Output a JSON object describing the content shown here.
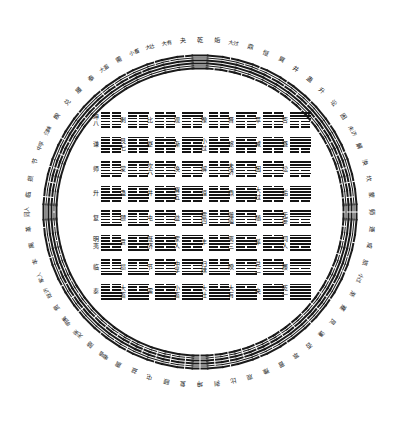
{
  "diagram": {
    "title_en": "Fuxi 64 Hexagram Circular and Square Diagram",
    "type": "iching-fuxi-arrangement",
    "background_color": "#ffffff",
    "ink_color": "#1a1a1a",
    "circle": {
      "name": "圆图",
      "count": 64,
      "radius_px": 172,
      "center": {
        "x": 200,
        "y": 212
      },
      "start_angle_deg": -90,
      "direction": "clockwise"
    },
    "square": {
      "name": "方图",
      "rows": 8,
      "cols": 8,
      "count": 64
    },
    "legend": {
      "yang_label": "阳爻 (solid line)",
      "yin_label": "阴爻 (broken line)",
      "read_order": "bottom line first"
    }
  },
  "circle_hexagrams": [
    {
      "name": "乾",
      "lines": "111111"
    },
    {
      "name": "姤",
      "lines": "011111"
    },
    {
      "name": "大过",
      "lines": "011110"
    },
    {
      "name": "鼎",
      "lines": "011101"
    },
    {
      "name": "恒",
      "lines": "011100"
    },
    {
      "name": "巽",
      "lines": "011011"
    },
    {
      "name": "井",
      "lines": "011010"
    },
    {
      "name": "蛊",
      "lines": "011001"
    },
    {
      "name": "升",
      "lines": "011000"
    },
    {
      "name": "讼",
      "lines": "010111"
    },
    {
      "name": "困",
      "lines": "010110"
    },
    {
      "name": "未济",
      "lines": "010101"
    },
    {
      "name": "解",
      "lines": "010100"
    },
    {
      "name": "涣",
      "lines": "010011"
    },
    {
      "name": "坎",
      "lines": "010010"
    },
    {
      "name": "蒙",
      "lines": "010001"
    },
    {
      "name": "师",
      "lines": "010000"
    },
    {
      "name": "遯",
      "lines": "001111"
    },
    {
      "name": "咸",
      "lines": "001110"
    },
    {
      "name": "旅",
      "lines": "001101"
    },
    {
      "name": "小过",
      "lines": "001100"
    },
    {
      "name": "渐",
      "lines": "001011"
    },
    {
      "name": "蹇",
      "lines": "001010"
    },
    {
      "name": "艮",
      "lines": "001001"
    },
    {
      "name": "谦",
      "lines": "001000"
    },
    {
      "name": "否",
      "lines": "000111"
    },
    {
      "name": "萃",
      "lines": "000110"
    },
    {
      "name": "晋",
      "lines": "000101"
    },
    {
      "name": "豫",
      "lines": "000100"
    },
    {
      "name": "观",
      "lines": "000011"
    },
    {
      "name": "比",
      "lines": "000010"
    },
    {
      "name": "剥",
      "lines": "000001"
    },
    {
      "name": "坤",
      "lines": "000000"
    },
    {
      "name": "复",
      "lines": "100000"
    },
    {
      "name": "颐",
      "lines": "100001"
    },
    {
      "name": "屯",
      "lines": "100010"
    },
    {
      "name": "益",
      "lines": "100011"
    },
    {
      "name": "震",
      "lines": "100100"
    },
    {
      "name": "噬嗑",
      "lines": "100101"
    },
    {
      "name": "随",
      "lines": "100110"
    },
    {
      "name": "无妄",
      "lines": "100111"
    },
    {
      "name": "明夷",
      "lines": "101000"
    },
    {
      "name": "贲",
      "lines": "101001"
    },
    {
      "name": "既济",
      "lines": "101010"
    },
    {
      "name": "家人",
      "lines": "101011"
    },
    {
      "name": "丰",
      "lines": "101100"
    },
    {
      "name": "离",
      "lines": "101101"
    },
    {
      "name": "革",
      "lines": "101110"
    },
    {
      "name": "同人",
      "lines": "101111"
    },
    {
      "name": "临",
      "lines": "110000"
    },
    {
      "name": "损",
      "lines": "110001"
    },
    {
      "name": "节",
      "lines": "110010"
    },
    {
      "name": "中孚",
      "lines": "110011"
    },
    {
      "name": "归妹",
      "lines": "110100"
    },
    {
      "name": "睽",
      "lines": "110101"
    },
    {
      "name": "兑",
      "lines": "110110"
    },
    {
      "name": "履",
      "lines": "110111"
    },
    {
      "name": "泰",
      "lines": "111000"
    },
    {
      "name": "大畜",
      "lines": "111001"
    },
    {
      "name": "需",
      "lines": "111010"
    },
    {
      "name": "小畜",
      "lines": "111011"
    },
    {
      "name": "大壮",
      "lines": "111100"
    },
    {
      "name": "大有",
      "lines": "111101"
    },
    {
      "name": "夬",
      "lines": "111110"
    }
  ],
  "square_rows": [
    {
      "row": 1,
      "cells": [
        {
          "name": "坤",
          "extra": "八",
          "lines": "000000"
        },
        {
          "name": "剥",
          "extra": "",
          "lines": "000001"
        },
        {
          "name": "比",
          "extra": "",
          "lines": "000010"
        },
        {
          "name": "观",
          "extra": "",
          "lines": "000011"
        },
        {
          "name": "豫",
          "extra": "",
          "lines": "000100"
        },
        {
          "name": "晋",
          "extra": "",
          "lines": "000101"
        },
        {
          "name": "萃",
          "extra": "",
          "lines": "000110"
        },
        {
          "name": "否",
          "extra": "",
          "lines": "000111"
        }
      ]
    },
    {
      "row": 2,
      "cells": [
        {
          "name": "谦",
          "extra": "",
          "lines": "001000"
        },
        {
          "name": "艮",
          "extra": "七",
          "lines": "001001"
        },
        {
          "name": "蹇",
          "extra": "",
          "lines": "001010"
        },
        {
          "name": "渐",
          "extra": "",
          "lines": "001011"
        },
        {
          "name": "小过",
          "extra": "",
          "lines": "001100"
        },
        {
          "name": "旅",
          "extra": "",
          "lines": "001101"
        },
        {
          "name": "咸",
          "extra": "",
          "lines": "001110"
        },
        {
          "name": "遯",
          "extra": "",
          "lines": "001111"
        }
      ]
    },
    {
      "row": 3,
      "cells": [
        {
          "name": "师",
          "extra": "",
          "lines": "010000"
        },
        {
          "name": "蒙",
          "extra": "",
          "lines": "010001"
        },
        {
          "name": "坎",
          "extra": "六",
          "lines": "010010"
        },
        {
          "name": "涣",
          "extra": "",
          "lines": "010011"
        },
        {
          "name": "解",
          "extra": "",
          "lines": "010100"
        },
        {
          "name": "未济",
          "extra": "",
          "lines": "010101"
        },
        {
          "name": "困",
          "extra": "",
          "lines": "010110"
        },
        {
          "name": "讼",
          "extra": "",
          "lines": "010111"
        }
      ]
    },
    {
      "row": 4,
      "cells": [
        {
          "name": "升",
          "extra": "",
          "lines": "011000"
        },
        {
          "name": "蛊",
          "extra": "",
          "lines": "011001"
        },
        {
          "name": "井",
          "extra": "",
          "lines": "011010"
        },
        {
          "name": "巽",
          "extra": "五",
          "lines": "011011"
        },
        {
          "name": "恒",
          "extra": "",
          "lines": "011100"
        },
        {
          "name": "鼎",
          "extra": "",
          "lines": "011101"
        },
        {
          "name": "大过",
          "extra": "",
          "lines": "011110"
        },
        {
          "name": "姤",
          "extra": "",
          "lines": "011111"
        }
      ]
    },
    {
      "row": 5,
      "cells": [
        {
          "name": "复",
          "extra": "",
          "lines": "100000"
        },
        {
          "name": "颐",
          "extra": "",
          "lines": "100001"
        },
        {
          "name": "屯",
          "extra": "",
          "lines": "100010"
        },
        {
          "name": "益",
          "extra": "",
          "lines": "100011"
        },
        {
          "name": "震",
          "extra": "四",
          "lines": "100100"
        },
        {
          "name": "噬嗑",
          "extra": "",
          "lines": "100101"
        },
        {
          "name": "随",
          "extra": "",
          "lines": "100110"
        },
        {
          "name": "无妄",
          "extra": "",
          "lines": "100111"
        }
      ]
    },
    {
      "row": 6,
      "cells": [
        {
          "name": "明夷",
          "extra": "",
          "lines": "101000"
        },
        {
          "name": "贲",
          "extra": "",
          "lines": "101001"
        },
        {
          "name": "既济",
          "extra": "",
          "lines": "101010"
        },
        {
          "name": "家人",
          "extra": "",
          "lines": "101011"
        },
        {
          "name": "丰",
          "extra": "",
          "lines": "101100"
        },
        {
          "name": "离",
          "extra": "三",
          "lines": "101101"
        },
        {
          "name": "革",
          "extra": "",
          "lines": "101110"
        },
        {
          "name": "同人",
          "extra": "",
          "lines": "101111"
        }
      ]
    },
    {
      "row": 7,
      "cells": [
        {
          "name": "临",
          "extra": "",
          "lines": "110000"
        },
        {
          "name": "损",
          "extra": "",
          "lines": "110001"
        },
        {
          "name": "节",
          "extra": "",
          "lines": "110010"
        },
        {
          "name": "中孚",
          "extra": "",
          "lines": "110011"
        },
        {
          "name": "归妹",
          "extra": "",
          "lines": "110100"
        },
        {
          "name": "睽",
          "extra": "",
          "lines": "110101"
        },
        {
          "name": "兑",
          "extra": "二",
          "lines": "110110"
        },
        {
          "name": "履",
          "extra": "",
          "lines": "110111"
        }
      ]
    },
    {
      "row": 8,
      "cells": [
        {
          "name": "泰",
          "extra": "",
          "lines": "111000"
        },
        {
          "name": "大畜",
          "extra": "",
          "lines": "111001"
        },
        {
          "name": "需",
          "extra": "",
          "lines": "111010"
        },
        {
          "name": "小畜",
          "extra": "",
          "lines": "111011"
        },
        {
          "name": "大壮",
          "extra": "",
          "lines": "111100"
        },
        {
          "name": "大有",
          "extra": "",
          "lines": "111101"
        },
        {
          "name": "夬",
          "extra": "",
          "lines": "111110"
        },
        {
          "name": "乾",
          "extra": "一",
          "lines": "111111"
        }
      ]
    }
  ]
}
